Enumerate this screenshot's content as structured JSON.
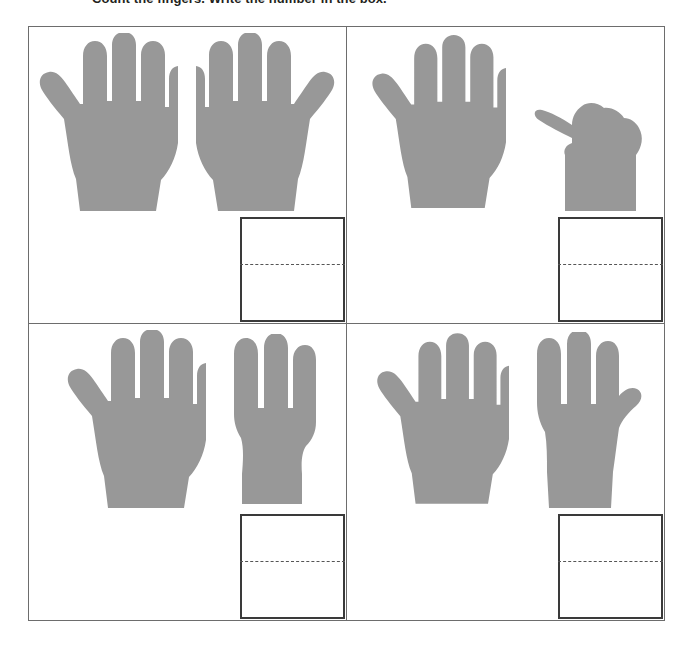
{
  "worksheet": {
    "instruction": "Count the fingers. Write the number in the box.",
    "hand_color": "#989898",
    "grid_line_color": "#6d6d6d",
    "answer_box_border_color": "#3a3a3a",
    "answer_box_rule_style": "dashed",
    "columns": 2,
    "rows": 2,
    "problems": [
      {
        "id": "problem-1",
        "position": "top-left",
        "left_hand": {
          "type": "open-hand-left",
          "fingers_shown": 5
        },
        "right_hand": {
          "type": "open-hand-right",
          "fingers_shown": 5
        },
        "total": 10,
        "answer_value": ""
      },
      {
        "id": "problem-2",
        "position": "top-right",
        "left_hand": {
          "type": "open-hand-left",
          "fingers_shown": 5
        },
        "right_hand": {
          "type": "closed-fist-right",
          "fingers_shown": 0
        },
        "total": 5,
        "answer_value": ""
      },
      {
        "id": "problem-3",
        "position": "bottom-left",
        "left_hand": {
          "type": "open-hand-left",
          "fingers_shown": 5
        },
        "right_hand": {
          "type": "three-fingers-right",
          "fingers_shown": 3
        },
        "total": 8,
        "answer_value": ""
      },
      {
        "id": "problem-4",
        "position": "bottom-right",
        "left_hand": {
          "type": "open-hand-left",
          "fingers_shown": 5
        },
        "right_hand": {
          "type": "four-fingers-right",
          "fingers_shown": 4
        },
        "total": 9,
        "answer_value": ""
      }
    ]
  }
}
